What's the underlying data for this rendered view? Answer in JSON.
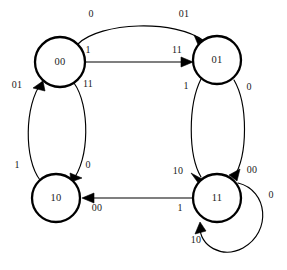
{
  "diagram": {
    "type": "finite-state-machine",
    "colors": {
      "background": "#ffffff",
      "node_stroke": "#000000",
      "node_fill": "#ffffff",
      "edge_stroke": "#000000",
      "text": "#1a1a1a"
    },
    "states": [
      {
        "id": "s00",
        "label": "00",
        "cx": 60,
        "cy": 62,
        "r": 25
      },
      {
        "id": "s01",
        "label": "01",
        "cx": 217,
        "cy": 60,
        "r": 24
      },
      {
        "id": "s10",
        "label": "10",
        "cx": 56,
        "cy": 198,
        "r": 24
      },
      {
        "id": "s11",
        "label": "11",
        "cx": 217,
        "cy": 198,
        "r": 24
      }
    ],
    "transitions": [
      {
        "id": "t1",
        "from": "00",
        "to": "01",
        "input": "0",
        "output": "01",
        "input_label_pos": {
          "x": 91,
          "y": 15
        },
        "output_label_pos": {
          "x": 184,
          "y": 15
        }
      },
      {
        "id": "t2",
        "from": "00",
        "to": "01",
        "input": "1",
        "output": "11",
        "input_label_pos": {
          "x": 88,
          "y": 51
        },
        "output_label_pos": {
          "x": 177,
          "y": 51
        }
      },
      {
        "id": "t3",
        "from": "10",
        "to": "00",
        "input": "1",
        "output": "01",
        "input_label_pos": {
          "x": 17,
          "y": 166
        },
        "output_label_pos": {
          "x": 17,
          "y": 86
        }
      },
      {
        "id": "t4",
        "from": "00",
        "to": "10",
        "input": "11",
        "output": "0",
        "input_label_pos": {
          "x": 88,
          "y": 85
        },
        "output_label_pos": {
          "x": 88,
          "y": 166
        }
      },
      {
        "id": "t5",
        "from": "01",
        "to": "11",
        "input": "1",
        "output": "10",
        "input_label_pos": {
          "x": 186,
          "y": 87
        },
        "output_label_pos": {
          "x": 178,
          "y": 172
        }
      },
      {
        "id": "t6",
        "from": "11",
        "to": "01",
        "input": "00",
        "output": "0",
        "input_label_pos": {
          "x": 252,
          "y": 171
        },
        "output_label_pos": {
          "x": 249,
          "y": 88
        }
      },
      {
        "id": "t7",
        "from": "11",
        "to": "10",
        "input": "1",
        "output": "00",
        "input_label_pos": {
          "x": 180,
          "y": 209
        },
        "output_label_pos": {
          "x": 97,
          "y": 209
        }
      },
      {
        "id": "t8",
        "from": "11",
        "to": "11",
        "input": "0",
        "output": "10",
        "input_label_pos": {
          "x": 271,
          "y": 196
        },
        "output_label_pos": {
          "x": 196,
          "y": 241
        }
      }
    ]
  }
}
